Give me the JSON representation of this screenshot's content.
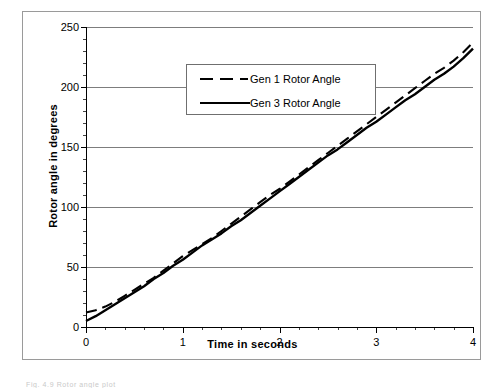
{
  "figure": {
    "background_color": "#ffffff",
    "frame_color": "#9a9a9a",
    "caption_fragment": "Fig.  4.9   Rotor angle plot"
  },
  "axes": {
    "x": {
      "label": "Time in seconds",
      "min": 0,
      "max": 4,
      "major_ticks": [
        0,
        1,
        2,
        3,
        4
      ],
      "tick_labels": [
        "0",
        "1",
        "2",
        "3",
        "4"
      ],
      "minor_tick_step": 0.2
    },
    "y": {
      "label": "Rotor angle in degrees",
      "min": 0,
      "max": 250,
      "major_ticks": [
        0,
        50,
        100,
        150,
        200,
        250
      ],
      "tick_labels": [
        "0",
        "50",
        "100",
        "150",
        "200",
        "250"
      ],
      "minor_tick_step": 10
    }
  },
  "legend": {
    "position": "top-left-inside",
    "border_color": "#6f6f6f",
    "entries": [
      {
        "label": "Gen 1 Rotor Angle",
        "style": "dashed",
        "color": "#000000"
      },
      {
        "label": "Gen 3 Rotor Angle",
        "style": "solid",
        "color": "#000000"
      }
    ]
  },
  "chart_data": {
    "type": "line",
    "title": "",
    "xlabel": "Time in seconds",
    "ylabel": "Rotor angle in degrees",
    "xlim": [
      0,
      4
    ],
    "ylim": [
      0,
      250
    ],
    "grid": true,
    "grid_axis": "y",
    "legend_position": "top-left-inside",
    "x": [
      0,
      0.1,
      0.2,
      0.3,
      0.4,
      0.5,
      0.6,
      0.7,
      0.8,
      0.9,
      1.0,
      1.1,
      1.2,
      1.3,
      1.4,
      1.5,
      1.6,
      1.7,
      1.8,
      1.9,
      2.0,
      2.1,
      2.2,
      2.3,
      2.4,
      2.5,
      2.6,
      2.7,
      2.8,
      2.9,
      3.0,
      3.1,
      3.2,
      3.3,
      3.4,
      3.5,
      3.6,
      3.7,
      3.8,
      3.9,
      4.0
    ],
    "series": [
      {
        "name": "Gen 1 Rotor Angle",
        "style": "dashed",
        "color": "#000000",
        "values": [
          12,
          14,
          17,
          21,
          26,
          31,
          36,
          41,
          47,
          53,
          59,
          64,
          69,
          74,
          80,
          86,
          92,
          98,
          104,
          110,
          115,
          121,
          127,
          133,
          139,
          145,
          151,
          157,
          163,
          169,
          175,
          181,
          187,
          193,
          199,
          205,
          211,
          216,
          222,
          229,
          237
        ]
      },
      {
        "name": "Gen 3 Rotor Angle",
        "style": "solid",
        "color": "#000000",
        "values": [
          5,
          9,
          14,
          19,
          24,
          29,
          34,
          40,
          45,
          51,
          56,
          62,
          68,
          73,
          78,
          84,
          89,
          95,
          101,
          107,
          113,
          119,
          125,
          131,
          137,
          143,
          148,
          154,
          160,
          166,
          171,
          177,
          183,
          189,
          194,
          200,
          206,
          211,
          217,
          224,
          232
        ]
      }
    ]
  }
}
